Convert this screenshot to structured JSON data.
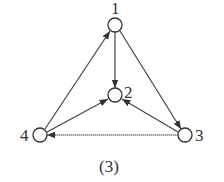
{
  "diagram": {
    "type": "directed-graph",
    "caption": "(3)",
    "nodes": [
      {
        "id": "1",
        "label": "1",
        "x": 115,
        "y": 25
      },
      {
        "id": "2",
        "label": "2",
        "x": 115,
        "y": 95
      },
      {
        "id": "3",
        "label": "3",
        "x": 185,
        "y": 135
      },
      {
        "id": "4",
        "label": "4",
        "x": 40,
        "y": 135
      }
    ],
    "edges": [
      {
        "from": "4",
        "to": "1"
      },
      {
        "from": "1",
        "to": "2"
      },
      {
        "from": "1",
        "to": "3"
      },
      {
        "from": "4",
        "to": "2"
      },
      {
        "from": "3",
        "to": "2"
      },
      {
        "from": "3",
        "to": "4"
      }
    ],
    "colors": {
      "stroke": "#333333",
      "node_fill": "#ffffff",
      "background": "#ffffff"
    }
  }
}
